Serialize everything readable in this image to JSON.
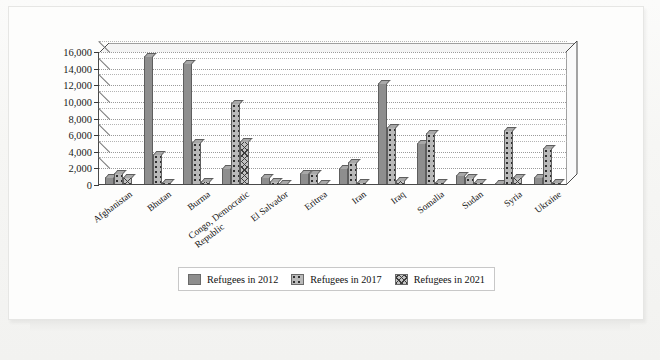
{
  "chart_data": {
    "type": "bar",
    "title": "",
    "xlabel": "",
    "ylabel": "",
    "ylim": [
      0,
      16000
    ],
    "grid": true,
    "legend_position": "bottom",
    "y_ticks": [
      "0",
      "2,000",
      "4,000",
      "6,000",
      "8,000",
      "10,000",
      "12,000",
      "14,000",
      "16,000"
    ],
    "y_tick_values": [
      0,
      2000,
      4000,
      6000,
      8000,
      10000,
      12000,
      14000,
      16000
    ],
    "categories": [
      "Afghanistan",
      "Bhutan",
      "Burma",
      "Congo, Democratic Republic",
      "El Salvador",
      "Eritrea",
      "Iran",
      "Iraq",
      "Somalia",
      "Sudan",
      "Syria",
      "Ukraine"
    ],
    "category_lines": [
      [
        "Afghanistan"
      ],
      [
        "Bhutan"
      ],
      [
        "Burma"
      ],
      [
        "Congo, Democratic",
        "Republic"
      ],
      [
        "El Salvador"
      ],
      [
        "Eritrea"
      ],
      [
        "Iran"
      ],
      [
        "Iraq"
      ],
      [
        "Somalia"
      ],
      [
        "Sudan"
      ],
      [
        "Syria"
      ],
      [
        "Ukraine"
      ]
    ],
    "series": [
      {
        "name": "Refugees in 2012",
        "color": "#8e8e8e",
        "pattern": "solid",
        "values": [
          800,
          15400,
          14600,
          1900,
          900,
          1300,
          1900,
          12100,
          4900,
          1100,
          30,
          900
        ]
      },
      {
        "name": "Refugees in 2017",
        "color": "#b9b9b9",
        "pattern": "dots",
        "values": [
          1300,
          3600,
          5100,
          9700,
          400,
          1300,
          2600,
          6900,
          6100,
          900,
          6500,
          4300
        ]
      },
      {
        "name": "Refugees in 2021",
        "color": "#c2c2c2",
        "pattern": "crosshatch",
        "values": [
          900,
          200,
          400,
          5200,
          100,
          100,
          200,
          500,
          200,
          200,
          800,
          200
        ]
      }
    ]
  },
  "legend": {
    "items": [
      {
        "label": "Refugees in 2012",
        "swatch": "solid-gray-swatch"
      },
      {
        "label": "Refugees in 2017",
        "swatch": "dotted-gray-swatch"
      },
      {
        "label": "Refugees in 2021",
        "swatch": "crosshatch-gray-swatch"
      }
    ]
  }
}
